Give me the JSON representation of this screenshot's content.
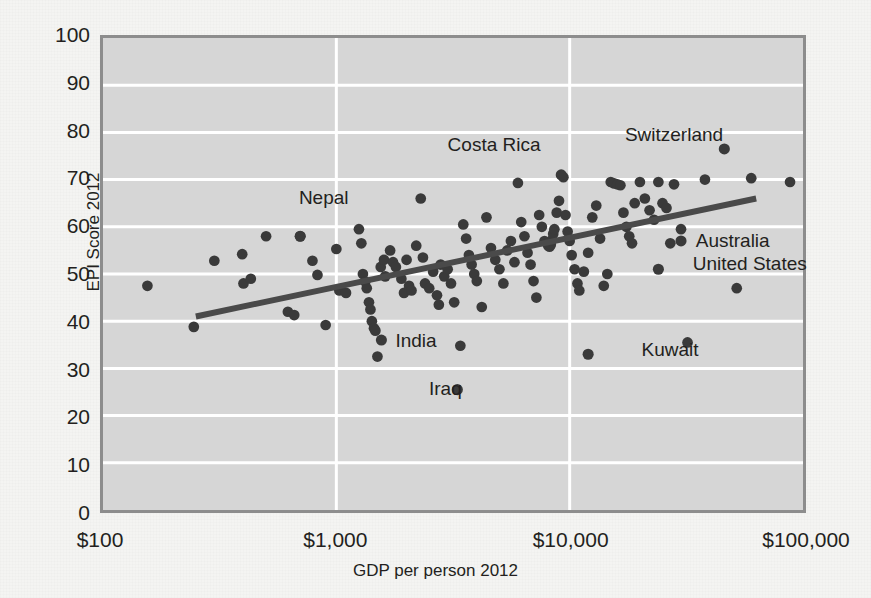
{
  "chart_data": {
    "type": "scatter",
    "title": "",
    "subtitle": "",
    "xlabel": "GDP per person 2012",
    "ylabel": "EPI Score 2012",
    "x_scale": "log",
    "y_scale": "linear",
    "xlim": [
      100,
      100000
    ],
    "ylim": [
      0,
      100
    ],
    "x_ticks": [
      100,
      1000,
      10000,
      100000
    ],
    "x_tick_labels": [
      "$100",
      "$1,000",
      "$10,000",
      "$100,000"
    ],
    "y_ticks": [
      0,
      10,
      20,
      30,
      40,
      50,
      60,
      70,
      80,
      90,
      100
    ],
    "y_tick_labels": [
      "0",
      "10",
      "20",
      "30",
      "40",
      "50",
      "60",
      "70",
      "80",
      "90",
      "100"
    ],
    "grid": "horizontal-and-vertical-white",
    "legend": "none",
    "plot_background": "#d6d6d6",
    "point_color": "#3a3a3a",
    "trendline_color": "#4a4a4a",
    "trendline": {
      "label": "linear fit on log(GDP)",
      "x_start": 250,
      "y_start": 41,
      "x_end": 63000,
      "y_end": 66
    },
    "annotations": [
      {
        "text": "Nepal",
        "x": 700,
        "y": 66,
        "anchor": "left"
      },
      {
        "text": "Costa Rica",
        "x": 3000,
        "y": 77,
        "anchor": "left"
      },
      {
        "text": "Switzerland",
        "x": 17000,
        "y": 79,
        "anchor": "left"
      },
      {
        "text": "India",
        "x": 1800,
        "y": 36,
        "anchor": "left"
      },
      {
        "text": "Iraq",
        "x": 2500,
        "y": 26,
        "anchor": "left"
      },
      {
        "text": "Kuwait",
        "x": 20000,
        "y": 34,
        "anchor": "left"
      },
      {
        "text": "Australia",
        "x": 34000,
        "y": 57,
        "anchor": "left"
      },
      {
        "text": "United States",
        "x": 33000,
        "y": 52,
        "anchor": "left"
      }
    ],
    "highlighted_points": [
      {
        "name": "Nepal",
        "x": 700,
        "y": 58
      },
      {
        "name": "Costa Rica",
        "x": 9200,
        "y": 71
      },
      {
        "name": "Switzerland",
        "x": 46000,
        "y": 76.5
      },
      {
        "name": "India",
        "x": 1560,
        "y": 36
      },
      {
        "name": "Iraq",
        "x": 3300,
        "y": 25.5
      },
      {
        "name": "Kuwait",
        "x": 12000,
        "y": 33
      },
      {
        "name": "Australia",
        "x": 30000,
        "y": 57
      },
      {
        "name": "United States",
        "x": 24000,
        "y": 51
      }
    ],
    "points": [
      {
        "x": 155,
        "y": 47.5
      },
      {
        "x": 245,
        "y": 38.8
      },
      {
        "x": 300,
        "y": 52.8
      },
      {
        "x": 395,
        "y": 54.2
      },
      {
        "x": 400,
        "y": 48.0
      },
      {
        "x": 430,
        "y": 49.0
      },
      {
        "x": 500,
        "y": 58.0
      },
      {
        "x": 620,
        "y": 42.0
      },
      {
        "x": 660,
        "y": 41.3
      },
      {
        "x": 700,
        "y": 58.0
      },
      {
        "x": 790,
        "y": 52.8
      },
      {
        "x": 830,
        "y": 49.8
      },
      {
        "x": 900,
        "y": 39.2
      },
      {
        "x": 1000,
        "y": 55.3
      },
      {
        "x": 1030,
        "y": 46.5
      },
      {
        "x": 1100,
        "y": 46.0
      },
      {
        "x": 1250,
        "y": 59.5
      },
      {
        "x": 1280,
        "y": 56.5
      },
      {
        "x": 1300,
        "y": 50.0
      },
      {
        "x": 1330,
        "y": 48.4
      },
      {
        "x": 1350,
        "y": 47.0
      },
      {
        "x": 1380,
        "y": 44.0
      },
      {
        "x": 1400,
        "y": 42.5
      },
      {
        "x": 1420,
        "y": 40.0
      },
      {
        "x": 1450,
        "y": 38.5
      },
      {
        "x": 1470,
        "y": 38.0
      },
      {
        "x": 1500,
        "y": 32.5
      },
      {
        "x": 1550,
        "y": 51.5
      },
      {
        "x": 1600,
        "y": 53.0
      },
      {
        "x": 1620,
        "y": 49.5
      },
      {
        "x": 1700,
        "y": 55.0
      },
      {
        "x": 1750,
        "y": 52.5
      },
      {
        "x": 1800,
        "y": 51.5
      },
      {
        "x": 1900,
        "y": 49.0
      },
      {
        "x": 1950,
        "y": 46.0
      },
      {
        "x": 2000,
        "y": 53.0
      },
      {
        "x": 2050,
        "y": 47.5
      },
      {
        "x": 2100,
        "y": 46.5
      },
      {
        "x": 2200,
        "y": 56.0
      },
      {
        "x": 2300,
        "y": 66.0
      },
      {
        "x": 2350,
        "y": 53.5
      },
      {
        "x": 2400,
        "y": 48.0
      },
      {
        "x": 2500,
        "y": 47.0
      },
      {
        "x": 2600,
        "y": 50.5
      },
      {
        "x": 2700,
        "y": 45.5
      },
      {
        "x": 2750,
        "y": 43.5
      },
      {
        "x": 2800,
        "y": 52.0
      },
      {
        "x": 2900,
        "y": 49.5
      },
      {
        "x": 3000,
        "y": 51.0
      },
      {
        "x": 3100,
        "y": 48.0
      },
      {
        "x": 3200,
        "y": 44.0
      },
      {
        "x": 3400,
        "y": 34.8
      },
      {
        "x": 3500,
        "y": 60.5
      },
      {
        "x": 3600,
        "y": 57.5
      },
      {
        "x": 3700,
        "y": 54.0
      },
      {
        "x": 3800,
        "y": 52.0
      },
      {
        "x": 3900,
        "y": 50.0
      },
      {
        "x": 4000,
        "y": 48.5
      },
      {
        "x": 4200,
        "y": 43.0
      },
      {
        "x": 4400,
        "y": 62.0
      },
      {
        "x": 4600,
        "y": 55.5
      },
      {
        "x": 4800,
        "y": 53.0
      },
      {
        "x": 5000,
        "y": 51.0
      },
      {
        "x": 5200,
        "y": 48.0
      },
      {
        "x": 5400,
        "y": 55.0
      },
      {
        "x": 5600,
        "y": 57.0
      },
      {
        "x": 5800,
        "y": 52.5
      },
      {
        "x": 6000,
        "y": 69.3
      },
      {
        "x": 6200,
        "y": 61.0
      },
      {
        "x": 6400,
        "y": 58.0
      },
      {
        "x": 6600,
        "y": 54.5
      },
      {
        "x": 6800,
        "y": 52.0
      },
      {
        "x": 7000,
        "y": 48.5
      },
      {
        "x": 7200,
        "y": 45.0
      },
      {
        "x": 7400,
        "y": 62.5
      },
      {
        "x": 7600,
        "y": 60.0
      },
      {
        "x": 7800,
        "y": 57.0
      },
      {
        "x": 8000,
        "y": 56.5
      },
      {
        "x": 8100,
        "y": 56.0
      },
      {
        "x": 8200,
        "y": 55.8
      },
      {
        "x": 8300,
        "y": 56.2
      },
      {
        "x": 8400,
        "y": 57.2
      },
      {
        "x": 8500,
        "y": 58.5
      },
      {
        "x": 8600,
        "y": 59.5
      },
      {
        "x": 8800,
        "y": 63.0
      },
      {
        "x": 9000,
        "y": 65.5
      },
      {
        "x": 9400,
        "y": 70.5
      },
      {
        "x": 9600,
        "y": 62.5
      },
      {
        "x": 9800,
        "y": 59.0
      },
      {
        "x": 10000,
        "y": 57.0
      },
      {
        "x": 10200,
        "y": 54.0
      },
      {
        "x": 10500,
        "y": 51.0
      },
      {
        "x": 10800,
        "y": 48.0
      },
      {
        "x": 11000,
        "y": 46.5
      },
      {
        "x": 11500,
        "y": 50.5
      },
      {
        "x": 12000,
        "y": 54.5
      },
      {
        "x": 12500,
        "y": 62.0
      },
      {
        "x": 13000,
        "y": 64.5
      },
      {
        "x": 13500,
        "y": 57.5
      },
      {
        "x": 14000,
        "y": 47.5
      },
      {
        "x": 14500,
        "y": 50.0
      },
      {
        "x": 15000,
        "y": 69.5
      },
      {
        "x": 15500,
        "y": 69.2
      },
      {
        "x": 16000,
        "y": 69.0
      },
      {
        "x": 16500,
        "y": 68.8
      },
      {
        "x": 17000,
        "y": 63.0
      },
      {
        "x": 17500,
        "y": 60.0
      },
      {
        "x": 18000,
        "y": 58.0
      },
      {
        "x": 18500,
        "y": 56.5
      },
      {
        "x": 19000,
        "y": 65.0
      },
      {
        "x": 20000,
        "y": 69.5
      },
      {
        "x": 21000,
        "y": 66.0
      },
      {
        "x": 22000,
        "y": 63.5
      },
      {
        "x": 23000,
        "y": 61.5
      },
      {
        "x": 24000,
        "y": 69.5
      },
      {
        "x": 25000,
        "y": 65.0
      },
      {
        "x": 26000,
        "y": 64.0
      },
      {
        "x": 27000,
        "y": 56.5
      },
      {
        "x": 28000,
        "y": 69.0
      },
      {
        "x": 30000,
        "y": 59.5
      },
      {
        "x": 32000,
        "y": 35.5
      },
      {
        "x": 38000,
        "y": 70.0
      },
      {
        "x": 52000,
        "y": 47.0
      },
      {
        "x": 60000,
        "y": 70.3
      },
      {
        "x": 88000,
        "y": 69.5
      }
    ]
  }
}
